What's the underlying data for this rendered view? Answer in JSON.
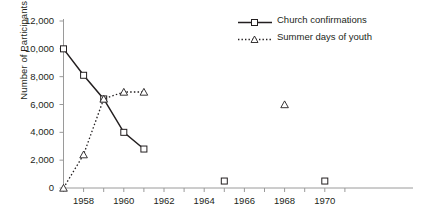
{
  "chart_data": {
    "type": "line",
    "title": "",
    "xlabel": "",
    "ylabel": "Number of Participants in Estonia",
    "xlim": [
      1956.5,
      1970.8
    ],
    "ylim": [
      0,
      12000
    ],
    "grid": false,
    "legend_position": "top-right",
    "yticks": [
      "0",
      "2,000",
      "4,000",
      "6,000",
      "8,000",
      "10,000",
      "12,000"
    ],
    "ytick_values": [
      0,
      2000,
      4000,
      6000,
      8000,
      10000,
      12000
    ],
    "xticks": [
      "1958",
      "1960",
      "1962",
      "1964",
      "1966",
      "1968",
      "1970"
    ],
    "xtick_values": [
      1958,
      1960,
      1962,
      1964,
      1966,
      1968,
      1970
    ],
    "series": [
      {
        "name": "Church confirmations",
        "marker": "square",
        "line": "solid",
        "color": "#231f20",
        "x": [
          1957,
          1958,
          1959,
          1960,
          1961
        ],
        "values": [
          10000,
          8100,
          6400,
          4000,
          2800
        ]
      },
      {
        "name": "Summer days of youth",
        "marker": "triangle",
        "line": "dotted",
        "color": "#231f20",
        "x": [
          1957,
          1958,
          1959,
          1960,
          1961
        ],
        "values": [
          0,
          2400,
          6400,
          6900,
          6900
        ]
      },
      {
        "name": "Church confirmations (isolated points)",
        "marker": "square",
        "line": "none",
        "color": "#231f20",
        "x": [
          1965,
          1970
        ],
        "values": [
          500,
          500
        ]
      },
      {
        "name": "Summer days of youth (isolated point)",
        "marker": "triangle",
        "line": "none",
        "color": "#231f20",
        "x": [
          1968
        ],
        "values": [
          6000
        ]
      }
    ]
  },
  "legend": {
    "items": [
      {
        "label": "Church confirmations",
        "marker": "square-marker",
        "line": "solid-line"
      },
      {
        "label": "Summer days of youth",
        "marker": "triangle-marker",
        "line": "dotted-line"
      }
    ]
  },
  "axes": {
    "y_title": "Number of Participants in Estonia"
  },
  "caption": {
    "partial_text": ""
  }
}
